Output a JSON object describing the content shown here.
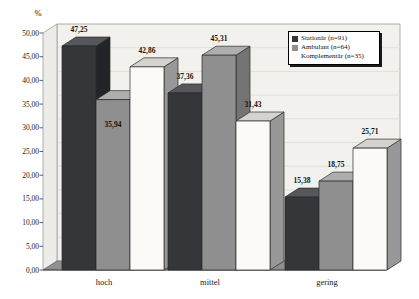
{
  "figure": {
    "background": "#ffffff",
    "wall_color": "#f2f1ed",
    "left_wall_color": "#edece8",
    "floor_color": "#8f8f8f",
    "gridline_color": "#dcdcd7",
    "outline_color": "#2a2a2a"
  },
  "chart_data": {
    "type": "bar",
    "style": "3d-column",
    "title": "",
    "unit_label": "%",
    "categories": [
      "hoch",
      "mittel",
      "gering"
    ],
    "series": [
      {
        "name": "Stationär (n=91)",
        "color": "#35363a",
        "top_color": "#56575d",
        "side_color": "#232428",
        "values": [
          47.25,
          37.36,
          15.38
        ],
        "labels": [
          "47,25",
          "37,36",
          "15,38"
        ],
        "label_inside": [
          false,
          false,
          false
        ]
      },
      {
        "name": "Ambulant (n=64)",
        "color": "#8f8f8f",
        "top_color": "#aeaeae",
        "side_color": "#737373",
        "values": [
          35.94,
          45.31,
          18.75
        ],
        "labels": [
          "35,94",
          "45,31",
          "18,75"
        ],
        "label_inside": [
          true,
          false,
          false
        ]
      },
      {
        "name": "Komplementär (n=35)",
        "color": "#fbfaf7",
        "top_color": "#d4d3cf",
        "side_color": "#989898",
        "values": [
          42.86,
          31.43,
          25.71
        ],
        "labels": [
          "42,86",
          "31,43",
          "25,71"
        ],
        "label_inside": [
          false,
          false,
          false
        ]
      }
    ],
    "y_ticks": [
      "0,00",
      "5,00",
      "10,00",
      "15,00",
      "20,00",
      "25,00",
      "30,00",
      "35,00",
      "40,00",
      "45,00",
      "50,00"
    ],
    "ylim": [
      0,
      50
    ],
    "grid": true,
    "legend_position": "top-right"
  },
  "legend": {
    "items": [
      {
        "label": "Stationär (n=91)"
      },
      {
        "label": "Ambulant (n=64)"
      },
      {
        "label": "Komplementär (n=35)"
      }
    ]
  }
}
